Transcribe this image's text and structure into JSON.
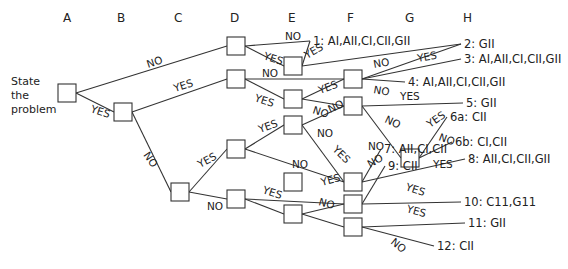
{
  "diagram": {
    "type": "decision-tree",
    "start_label": [
      "State",
      "the",
      "problem"
    ],
    "columns": [
      {
        "label": "A",
        "x": 67
      },
      {
        "label": "B",
        "x": 123
      },
      {
        "label": "C",
        "x": 180
      },
      {
        "label": "D",
        "x": 236
      },
      {
        "label": "E",
        "x": 293
      },
      {
        "label": "F",
        "x": 353
      },
      {
        "label": "G",
        "x": 410
      },
      {
        "label": "H",
        "x": 466
      }
    ],
    "nodes": [
      {
        "id": "A",
        "x": 67,
        "y": 93
      },
      {
        "id": "B",
        "x": 123,
        "y": 112
      },
      {
        "id": "C",
        "x": 180,
        "y": 192
      },
      {
        "id": "D1",
        "x": 236,
        "y": 46
      },
      {
        "id": "D2",
        "x": 236,
        "y": 79
      },
      {
        "id": "D3",
        "x": 236,
        "y": 149
      },
      {
        "id": "D4",
        "x": 236,
        "y": 199
      },
      {
        "id": "E1",
        "x": 293,
        "y": 66
      },
      {
        "id": "E2",
        "x": 293,
        "y": 99
      },
      {
        "id": "E3",
        "x": 293,
        "y": 125
      },
      {
        "id": "E4",
        "x": 293,
        "y": 182
      },
      {
        "id": "E5",
        "x": 293,
        "y": 214
      },
      {
        "id": "F1",
        "x": 353,
        "y": 79
      },
      {
        "id": "F2",
        "x": 353,
        "y": 106
      },
      {
        "id": "F3",
        "x": 353,
        "y": 182
      },
      {
        "id": "F4",
        "x": 353,
        "y": 204
      },
      {
        "id": "F5",
        "x": 353,
        "y": 227
      },
      {
        "id": "G1",
        "x": 410,
        "y": 158
      }
    ],
    "outcomes": [
      {
        "id": "o1",
        "text": "1: AI,AII,CI,CII,GII",
        "x": 313,
        "y": 45
      },
      {
        "id": "o2",
        "text": "2: GII",
        "x": 464,
        "y": 48
      },
      {
        "id": "o3",
        "text": "3: AI,AII,CI,CII,GII",
        "x": 464,
        "y": 63
      },
      {
        "id": "o4",
        "text": "4: AI,AII,CI,CII,GII",
        "x": 408,
        "y": 86
      },
      {
        "id": "o5",
        "text": "5: GII",
        "x": 466,
        "y": 107
      },
      {
        "id": "o6a",
        "text": "6a: CII",
        "x": 450,
        "y": 121
      },
      {
        "id": "o6b",
        "text": "6b: CI,CII",
        "x": 455,
        "y": 146
      },
      {
        "id": "o7",
        "text": "7: AII,CI,CII",
        "x": 384,
        "y": 153
      },
      {
        "id": "o8",
        "text": "8: AII,CI,CII,GII",
        "x": 468,
        "y": 163
      },
      {
        "id": "o9",
        "text": "9: CII",
        "x": 388,
        "y": 170
      },
      {
        "id": "o10",
        "text": "10: C11,G11",
        "x": 464,
        "y": 206
      },
      {
        "id": "o11",
        "text": "11: GII",
        "x": 468,
        "y": 227
      },
      {
        "id": "o12",
        "text": "12: CII",
        "x": 437,
        "y": 250
      }
    ],
    "edges": [
      {
        "from": "A",
        "to": "D1",
        "label": "NO",
        "lx": 148,
        "ly": 68,
        "rot": -18
      },
      {
        "from": "A",
        "to": "B",
        "label": "YES",
        "lx": 90,
        "ly": 112,
        "rot": 18
      },
      {
        "from": "B",
        "to": "D2",
        "label": "YES",
        "lx": 175,
        "ly": 92,
        "rot": -18
      },
      {
        "from": "B",
        "to": "C",
        "label": "NO",
        "lx": 143,
        "ly": 155,
        "rot": 55
      },
      {
        "from": "C",
        "to": "D3",
        "label": "YES",
        "lx": 200,
        "ly": 168,
        "rot": -28
      },
      {
        "from": "C",
        "to": "D4",
        "label": "NO",
        "lx": 207,
        "ly": 210,
        "rot": 0
      },
      {
        "from": "D1",
        "to": "o1",
        "label": "NO",
        "lx": 285,
        "ly": 40,
        "rot": 0
      },
      {
        "from": "D1",
        "to": "E1",
        "label": "YES",
        "lx": 263,
        "ly": 59,
        "rot": 18
      },
      {
        "from": "E1",
        "to": "o1",
        "label": "YES",
        "lx": 307,
        "ly": 59,
        "rot": -30
      },
      {
        "from": "E1",
        "to": "o2",
        "label": "",
        "lx": 0,
        "ly": 0,
        "rot": 0
      },
      {
        "from": "D2",
        "to": "F1",
        "label": "NO",
        "lx": 262,
        "ly": 77,
        "rot": 0
      },
      {
        "from": "D2",
        "to": "E2",
        "label": "YES",
        "lx": 254,
        "ly": 101,
        "rot": 18
      },
      {
        "from": "E2",
        "to": "F1",
        "label": "YES",
        "lx": 320,
        "ly": 94,
        "rot": -20
      },
      {
        "from": "E2",
        "to": "F2",
        "label": "NO",
        "lx": 312,
        "ly": 113,
        "rot": 18
      },
      {
        "from": "F1",
        "to": "o3",
        "label": "YES",
        "lx": 418,
        "ly": 62,
        "rot": -10
      },
      {
        "from": "F1",
        "to": "o2",
        "label": "NO",
        "lx": 374,
        "ly": 68,
        "rot": -10
      },
      {
        "from": "F1",
        "to": "o4",
        "label": "NO",
        "lx": 373,
        "ly": 93,
        "rot": 10
      },
      {
        "from": "F2",
        "to": "o5",
        "label": "YES",
        "lx": 400,
        "ly": 100,
        "rot": 0
      },
      {
        "from": "F2",
        "to": "G1",
        "label": "NO",
        "lx": 384,
        "ly": 122,
        "rot": 25
      },
      {
        "from": "G1",
        "to": "o6a",
        "label": "YES",
        "lx": 430,
        "ly": 128,
        "rot": -35
      },
      {
        "from": "G1",
        "to": "o6b",
        "label": "NO",
        "lx": 438,
        "ly": 140,
        "rot": 20
      },
      {
        "from": "D3",
        "to": "E3",
        "label": "YES",
        "lx": 260,
        "ly": 133,
        "rot": -20
      },
      {
        "from": "D3",
        "to": "F3",
        "label": "NO",
        "lx": 317,
        "ly": 137,
        "rot": 0
      },
      {
        "from": "E3",
        "to": "F2",
        "label": "NO",
        "lx": 330,
        "ly": 113,
        "rot": -25
      },
      {
        "from": "E3",
        "to": "F3",
        "label": "YES",
        "lx": 332,
        "ly": 150,
        "rot": 45
      },
      {
        "from": "F3",
        "to": "o7",
        "label": "NO",
        "lx": 368,
        "ly": 150,
        "rot": 0
      },
      {
        "from": "F3",
        "to": "o8",
        "label": "YES",
        "lx": 433,
        "ly": 168,
        "rot": 0
      },
      {
        "from": "D4",
        "to": "F4",
        "label": "NO",
        "lx": 292,
        "ly": 168,
        "rot": 0
      },
      {
        "from": "D4",
        "to": "E5",
        "label": "YES",
        "lx": 262,
        "ly": 193,
        "rot": 18
      },
      {
        "from": "E5",
        "to": "F4",
        "label": "YES",
        "lx": 322,
        "ly": 186,
        "rot": -15
      },
      {
        "from": "E5",
        "to": "F5",
        "label": "NO",
        "lx": 318,
        "ly": 205,
        "rot": 15
      },
      {
        "from": "F4",
        "to": "o9",
        "label": "NO",
        "lx": 370,
        "ly": 168,
        "rot": -30
      },
      {
        "from": "F4",
        "to": "o10",
        "label": "YES",
        "lx": 405,
        "ly": 190,
        "rot": 18
      },
      {
        "from": "F5",
        "to": "o11",
        "label": "YES",
        "lx": 406,
        "ly": 212,
        "rot": 15
      },
      {
        "from": "F5",
        "to": "o12",
        "label": "NO",
        "lx": 390,
        "ly": 243,
        "rot": 40
      }
    ]
  }
}
